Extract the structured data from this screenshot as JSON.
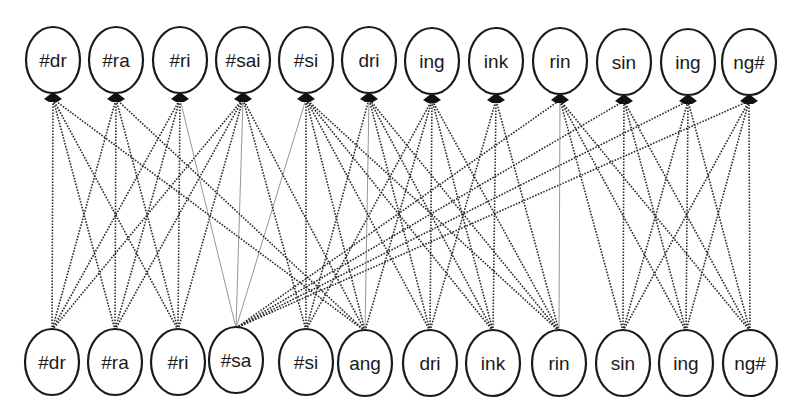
{
  "diagram": {
    "type": "bipartite-graph",
    "colors": {
      "node_stroke": "#1a1a1a",
      "edge": "#2a2a2a",
      "edge_thin": "#8a8a8a",
      "background": "#ffffff"
    },
    "top_nodes": [
      {
        "id": "t0",
        "label": "#dr",
        "x": 53,
        "y": 60
      },
      {
        "id": "t1",
        "label": "#ra",
        "x": 116,
        "y": 60
      },
      {
        "id": "t2",
        "label": "#ri",
        "x": 180,
        "y": 60
      },
      {
        "id": "t3",
        "label": "#sai",
        "x": 243,
        "y": 60
      },
      {
        "id": "t4",
        "label": "#si",
        "x": 306,
        "y": 60
      },
      {
        "id": "t5",
        "label": "dri",
        "x": 369,
        "y": 60
      },
      {
        "id": "t6",
        "label": "ing",
        "x": 432,
        "y": 61
      },
      {
        "id": "t7",
        "label": "ink",
        "x": 496,
        "y": 61
      },
      {
        "id": "t8",
        "label": "rin",
        "x": 560,
        "y": 61
      },
      {
        "id": "t9",
        "label": "sin",
        "x": 624,
        "y": 62
      },
      {
        "id": "t10",
        "label": "ing",
        "x": 688,
        "y": 62
      },
      {
        "id": "t11",
        "label": "ng#",
        "x": 749,
        "y": 62
      }
    ],
    "bottom_nodes": [
      {
        "id": "b0",
        "label": "#dr",
        "x": 52,
        "y": 362
      },
      {
        "id": "b1",
        "label": "#ra",
        "x": 115,
        "y": 362
      },
      {
        "id": "b2",
        "label": "#ri",
        "x": 178,
        "y": 362
      },
      {
        "id": "b3",
        "label": "#sa",
        "x": 236,
        "y": 360
      },
      {
        "id": "b4",
        "label": "#si",
        "x": 306,
        "y": 362
      },
      {
        "id": "b5",
        "label": "ang",
        "x": 365,
        "y": 363
      },
      {
        "id": "b6",
        "label": "dri",
        "x": 430,
        "y": 363
      },
      {
        "id": "b7",
        "label": "ink",
        "x": 493,
        "y": 363
      },
      {
        "id": "b8",
        "label": "rin",
        "x": 559,
        "y": 363
      },
      {
        "id": "b9",
        "label": "sin",
        "x": 623,
        "y": 363
      },
      {
        "id": "b10",
        "label": "ing",
        "x": 686,
        "y": 363
      },
      {
        "id": "b11",
        "label": "ng#",
        "x": 750,
        "y": 363
      }
    ],
    "edges": [
      {
        "from": "b0",
        "to": "t0"
      },
      {
        "from": "b0",
        "to": "t1"
      },
      {
        "from": "b0",
        "to": "t2"
      },
      {
        "from": "b0",
        "to": "t3"
      },
      {
        "from": "b1",
        "to": "t0"
      },
      {
        "from": "b1",
        "to": "t1"
      },
      {
        "from": "b1",
        "to": "t2"
      },
      {
        "from": "b1",
        "to": "t3"
      },
      {
        "from": "b2",
        "to": "t0"
      },
      {
        "from": "b2",
        "to": "t1"
      },
      {
        "from": "b2",
        "to": "t2"
      },
      {
        "from": "b2",
        "to": "t3"
      },
      {
        "from": "b3",
        "to": "t2",
        "style": "thin"
      },
      {
        "from": "b3",
        "to": "t3",
        "style": "thin"
      },
      {
        "from": "b3",
        "to": "t4",
        "style": "thin"
      },
      {
        "from": "b3",
        "to": "t8"
      },
      {
        "from": "b3",
        "to": "t9"
      },
      {
        "from": "b3",
        "to": "t10"
      },
      {
        "from": "b3",
        "to": "t11"
      },
      {
        "from": "b4",
        "to": "t3"
      },
      {
        "from": "b4",
        "to": "t4"
      },
      {
        "from": "b4",
        "to": "t5"
      },
      {
        "from": "b4",
        "to": "t6"
      },
      {
        "from": "b5",
        "to": "t0"
      },
      {
        "from": "b5",
        "to": "t1"
      },
      {
        "from": "b5",
        "to": "t3"
      },
      {
        "from": "b5",
        "to": "t4"
      },
      {
        "from": "b5",
        "to": "t5",
        "style": "thin"
      },
      {
        "from": "b5",
        "to": "t6"
      },
      {
        "from": "b6",
        "to": "t4"
      },
      {
        "from": "b6",
        "to": "t5"
      },
      {
        "from": "b6",
        "to": "t6"
      },
      {
        "from": "b6",
        "to": "t7"
      },
      {
        "from": "b7",
        "to": "t4"
      },
      {
        "from": "b7",
        "to": "t5"
      },
      {
        "from": "b7",
        "to": "t6"
      },
      {
        "from": "b7",
        "to": "t7"
      },
      {
        "from": "b8",
        "to": "t4"
      },
      {
        "from": "b8",
        "to": "t5"
      },
      {
        "from": "b8",
        "to": "t6"
      },
      {
        "from": "b8",
        "to": "t7"
      },
      {
        "from": "b8",
        "to": "t8",
        "style": "thin"
      },
      {
        "from": "b9",
        "to": "t8"
      },
      {
        "from": "b9",
        "to": "t9"
      },
      {
        "from": "b9",
        "to": "t10"
      },
      {
        "from": "b9",
        "to": "t11"
      },
      {
        "from": "b10",
        "to": "t8"
      },
      {
        "from": "b10",
        "to": "t9"
      },
      {
        "from": "b10",
        "to": "t10"
      },
      {
        "from": "b10",
        "to": "t11"
      },
      {
        "from": "b11",
        "to": "t8"
      },
      {
        "from": "b11",
        "to": "t9"
      },
      {
        "from": "b11",
        "to": "t10"
      },
      {
        "from": "b11",
        "to": "t11"
      }
    ],
    "node_rx": 27,
    "node_ry": 33
  }
}
